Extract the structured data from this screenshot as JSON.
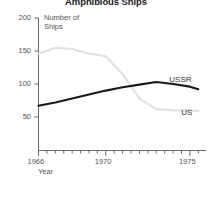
{
  "chart_data": {
    "type": "line",
    "title": "Amphibious Ships",
    "xlabel": "Year",
    "ylabel": "Number of\nShips",
    "xlim": [
      1966,
      1975.6
    ],
    "ylim": [
      0,
      200
    ],
    "xticks": [
      1966,
      1967,
      1968,
      1969,
      1970,
      1971,
      1972,
      1973,
      1974,
      1975
    ],
    "xticklabels": [
      "1966",
      "",
      "",
      "",
      "1970",
      "",
      "",
      "",
      "",
      "1975"
    ],
    "major_xticks": [
      1966,
      1970,
      1975
    ],
    "yticks": [
      50,
      100,
      150,
      200
    ],
    "yticklabels": [
      "50",
      "100",
      "150",
      "200"
    ],
    "grid": false,
    "legend": "inline-right-end-labels",
    "series": [
      {
        "name": "USSR",
        "color": "#1a1a1a",
        "width": 2.1,
        "x": [
          1966,
          1967,
          1968,
          1969,
          1970,
          1971,
          1972,
          1973,
          1974,
          1975,
          1975.5
        ],
        "values": [
          67,
          72,
          78,
          84,
          90,
          95,
          99,
          103,
          100,
          96,
          92
        ]
      },
      {
        "name": "US",
        "color": "#e0e0e0",
        "width": 2.1,
        "x": [
          1966,
          1967,
          1968,
          1969,
          1970,
          1971,
          1972,
          1973,
          1974,
          1975,
          1975.5
        ],
        "values": [
          146,
          155,
          153,
          146,
          142,
          115,
          78,
          62,
          60,
          60,
          59
        ]
      }
    ]
  },
  "labels": {
    "ussr": "USSR",
    "us": "US",
    "year": "Year",
    "number_of_ships_line1": "Number of",
    "number_of_ships_line2": "Ships"
  },
  "ticks": {
    "y200": "200",
    "y150": "150",
    "y100": "100",
    "y50": "50",
    "x1966": "1966",
    "x1970": "1970",
    "x1975": "1975"
  }
}
